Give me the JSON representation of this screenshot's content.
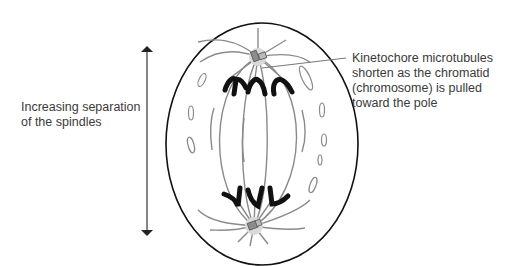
{
  "labels": {
    "separation": {
      "lines": [
        "Increasing separation",
        "of the spindles"
      ]
    },
    "kinetochore": {
      "lines": [
        "Kinetochore microtubules",
        "shorten as the chromatid",
        "(chromosome) is pulled",
        "toward the pole"
      ]
    }
  },
  "colors": {
    "background": "#ffffff",
    "cell_outline": "#111111",
    "microtubule": "#8a8a8a",
    "chromosome": "#111111",
    "centrosome_halo": "#d9d9d9",
    "centriole": "#8c8c8c",
    "text": "#3a3a3a"
  },
  "elements": {
    "arrow": "double-headed vertical arrow indicating spindle pole separation",
    "cell": "oval cell in anaphase",
    "poles": [
      "top centrosome with centriole pair",
      "bottom centrosome with centriole pair"
    ],
    "chromosomes_top": 3,
    "chromosomes_bottom": 3
  }
}
